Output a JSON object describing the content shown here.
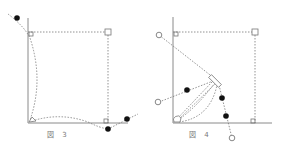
{
  "figures": [
    {
      "id": "fig3",
      "caption": "図 3",
      "caption_pos": {
        "x": 47,
        "y": 133
      }
    },
    {
      "id": "fig4",
      "caption": "図 4",
      "caption_pos": {
        "x": 189,
        "y": 133
      }
    }
  ],
  "colors": {
    "axis": "#888888",
    "dotted": "#777777",
    "filled_dot": "#111111",
    "hollow_dot": "#888888",
    "caption": "#777777"
  }
}
